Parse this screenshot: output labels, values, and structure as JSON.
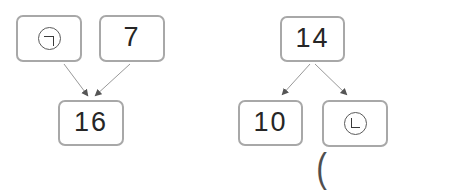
{
  "worksheet": {
    "description": "two number-bond diagrams",
    "colors": {
      "background": "#ffffff",
      "box_border": "#a8a8a8",
      "text": "#262626",
      "arrow_line": "#999999",
      "arrow_head": "#555555",
      "symbol_stroke": "#3a3a3a"
    },
    "diagrams": [
      {
        "name": "left-addition-bond",
        "top": [
          {
            "label": "㉠",
            "icon": "circled-giyeok"
          },
          {
            "label": "7"
          }
        ],
        "bottom": [
          {
            "label": "16"
          }
        ]
      },
      {
        "name": "right-decomposition-bond",
        "top": [
          {
            "label": "14"
          }
        ],
        "bottom": [
          {
            "label": "10"
          },
          {
            "label": "㉡",
            "icon": "circled-nieun"
          }
        ]
      }
    ],
    "answer_prompt": {
      "open_paren": "("
    }
  }
}
